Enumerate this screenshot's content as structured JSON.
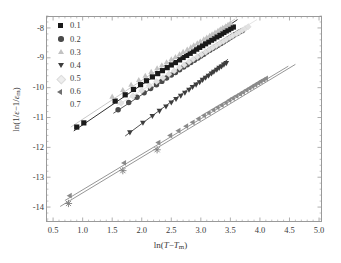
{
  "chart_data": {
    "type": "scatter",
    "title": "",
    "xlabel": "ln(T-Tm)",
    "ylabel": "ln(1/e-1/em)",
    "xlim": [
      0.38,
      5.05
    ],
    "ylim": [
      -14.5,
      -7.6
    ],
    "xticks": [
      0.5,
      1.0,
      1.5,
      2.0,
      2.5,
      3.0,
      3.5,
      4.0,
      4.5,
      5.0
    ],
    "xticklabels": [
      "0.5",
      "1.0",
      "1.5",
      "2.0",
      "2.5",
      "3.0",
      "3.5",
      "4.0",
      "4.5",
      "5.0"
    ],
    "yticks": [
      -8,
      -9,
      -10,
      -11,
      -12,
      -13,
      -14
    ],
    "yticklabels": [
      "-8",
      "-9",
      "-10",
      "-11",
      "-12",
      "-13",
      "-14"
    ],
    "grid": false,
    "minor_ticks": true,
    "legend_position": "upper-left-inside",
    "legend_title": "",
    "series": [
      {
        "name": "0.1",
        "marker": "square",
        "color": "#1a1a1a",
        "fit_line": {
          "x": [
            0.85,
            3.62
          ],
          "y": [
            -11.45,
            -7.72
          ],
          "color": "#1a1a1a"
        },
        "x": [
          0.9,
          1.02,
          1.55,
          1.72,
          1.86,
          1.98,
          2.08,
          2.18,
          2.27,
          2.35,
          2.43,
          2.5,
          2.57,
          2.64,
          2.7,
          2.76,
          2.82,
          2.88,
          2.93,
          2.98,
          3.03,
          3.08,
          3.13,
          3.18,
          3.22,
          3.27,
          3.31,
          3.35,
          3.39,
          3.43,
          3.47,
          3.51,
          3.55
        ],
        "y": [
          -11.32,
          -11.18,
          -10.45,
          -10.24,
          -10.06,
          -9.9,
          -9.77,
          -9.64,
          -9.53,
          -9.43,
          -9.33,
          -9.24,
          -9.16,
          -9.07,
          -8.99,
          -8.92,
          -8.85,
          -8.78,
          -8.71,
          -8.65,
          -8.59,
          -8.53,
          -8.47,
          -8.41,
          -8.36,
          -8.3,
          -8.25,
          -8.2,
          -8.15,
          -8.1,
          -8.06,
          -8.01,
          -7.97
        ]
      },
      {
        "name": "0.2",
        "marker": "circle",
        "color": "#4a4a4a",
        "fit_line": {
          "x": [
            1.52,
            3.72
          ],
          "y": [
            -10.86,
            -8.02
          ],
          "color": "#4a4a4a"
        },
        "x": [
          1.6,
          1.78,
          1.92,
          2.04,
          2.15,
          2.25,
          2.34,
          2.42,
          2.5,
          2.57,
          2.64,
          2.71,
          2.77,
          2.83,
          2.89,
          2.95,
          3.0,
          3.05,
          3.1,
          3.15,
          3.2,
          3.25,
          3.29,
          3.34,
          3.38,
          3.42,
          3.46,
          3.5,
          3.54,
          3.58,
          3.62,
          3.66,
          3.7
        ],
        "y": [
          -10.74,
          -10.5,
          -10.32,
          -10.17,
          -10.03,
          -9.9,
          -9.79,
          -9.68,
          -9.58,
          -9.49,
          -9.4,
          -9.31,
          -9.23,
          -9.16,
          -9.08,
          -9.01,
          -8.94,
          -8.88,
          -8.81,
          -8.75,
          -8.69,
          -8.63,
          -8.58,
          -8.52,
          -8.47,
          -8.42,
          -8.37,
          -8.32,
          -8.27,
          -8.22,
          -8.18,
          -8.13,
          -8.09
        ]
      },
      {
        "name": "0.3",
        "marker": "triangle-up",
        "color": "#c2c2c2",
        "fit_line": {
          "x": [
            0.8,
            3.58
          ],
          "y": [
            -11.32,
            -7.7
          ],
          "color": "#c2c2c2"
        },
        "x": [
          1.5,
          1.68,
          1.82,
          1.95,
          2.06,
          2.16,
          2.26,
          2.34,
          2.42,
          2.5,
          2.57,
          2.64,
          2.7,
          2.77,
          2.83,
          2.88,
          2.94,
          2.99,
          3.05,
          3.1,
          3.15,
          3.19,
          3.24,
          3.29,
          3.33,
          3.37,
          3.42,
          3.46,
          3.5
        ],
        "y": [
          -10.3,
          -10.08,
          -9.9,
          -9.74,
          -9.6,
          -9.47,
          -9.35,
          -9.25,
          -9.15,
          -9.05,
          -8.97,
          -8.88,
          -8.8,
          -8.72,
          -8.65,
          -8.58,
          -8.51,
          -8.45,
          -8.38,
          -8.32,
          -8.26,
          -8.21,
          -8.15,
          -8.09,
          -8.04,
          -7.99,
          -7.94,
          -7.89,
          -7.84
        ]
      },
      {
        "name": "0.4",
        "marker": "triangle-down",
        "color": "#3d3d3d",
        "fit_line": {
          "x": [
            1.72,
            3.46
          ],
          "y": [
            -11.62,
            -9.05
          ],
          "color": "#3d3d3d"
        },
        "x": [
          1.8,
          2.02,
          2.18,
          2.3,
          2.41,
          2.5,
          2.58,
          2.66,
          2.73,
          2.8,
          2.86,
          2.92,
          2.98,
          3.03,
          3.08,
          3.13,
          3.18,
          3.22,
          3.27,
          3.31,
          3.35,
          3.39,
          3.43
        ],
        "y": [
          -11.5,
          -11.18,
          -10.95,
          -10.78,
          -10.63,
          -10.5,
          -10.38,
          -10.27,
          -10.17,
          -10.07,
          -9.98,
          -9.9,
          -9.82,
          -9.74,
          -9.67,
          -9.6,
          -9.53,
          -9.47,
          -9.4,
          -9.34,
          -9.29,
          -9.23,
          -9.18
        ]
      },
      {
        "name": "0.5",
        "marker": "diamond",
        "color": "#e2e2e2",
        "fit_line": {
          "x": [
            1.58,
            3.95
          ],
          "y": [
            -10.6,
            -7.72
          ],
          "color": "#e2e2e2"
        },
        "x": [
          1.65,
          1.85,
          2.0,
          2.13,
          2.25,
          2.36,
          2.46,
          2.55,
          2.64,
          2.72,
          2.8,
          2.87,
          2.94,
          3.01,
          3.08,
          3.14,
          3.2,
          3.26,
          3.32,
          3.38,
          3.43,
          3.49,
          3.54,
          3.6,
          3.65,
          3.7,
          3.75,
          3.8
        ],
        "y": [
          -10.52,
          -10.28,
          -10.1,
          -9.94,
          -9.8,
          -9.67,
          -9.55,
          -9.44,
          -9.33,
          -9.24,
          -9.14,
          -9.05,
          -8.97,
          -8.89,
          -8.81,
          -8.73,
          -8.66,
          -8.59,
          -8.52,
          -8.45,
          -8.39,
          -8.32,
          -8.26,
          -8.2,
          -8.14,
          -8.08,
          -8.02,
          -7.96
        ]
      },
      {
        "name": "0.6",
        "marker": "triangle-left",
        "color": "#8a8a8a",
        "fit_line": {
          "x": [
            0.7,
            4.48
          ],
          "y": [
            -13.78,
            -9.28
          ],
          "color": "#8a8a8a"
        },
        "x": [
          0.78,
          1.7,
          2.28,
          2.48,
          2.62,
          2.75,
          2.86,
          2.96,
          3.05,
          3.13,
          3.21,
          3.28,
          3.35,
          3.42,
          3.48,
          3.54,
          3.6,
          3.66,
          3.71,
          3.77,
          3.82,
          3.87,
          3.92,
          3.97,
          4.01,
          4.06,
          4.1
        ],
        "y": [
          -13.62,
          -12.52,
          -11.84,
          -11.6,
          -11.44,
          -11.29,
          -11.16,
          -11.04,
          -10.93,
          -10.84,
          -10.74,
          -10.66,
          -10.58,
          -10.5,
          -10.42,
          -10.35,
          -10.28,
          -10.21,
          -10.15,
          -10.08,
          -10.02,
          -9.96,
          -9.9,
          -9.84,
          -9.79,
          -9.74,
          -9.69
        ]
      },
      {
        "name": "0.7",
        "marker": "star",
        "color": "#8a8a8a",
        "fit_line": {
          "x": [
            0.62,
            4.6
          ],
          "y": [
            -13.98,
            -9.22
          ],
          "color": "#8a8a8a"
        },
        "x": [
          0.76,
          1.68,
          2.26
        ],
        "y": [
          -13.88,
          -12.78,
          -12.08
        ]
      }
    ]
  },
  "legend": {
    "items": [
      {
        "label": "0.1",
        "marker": "square",
        "color": "#1a1a1a"
      },
      {
        "label": "0.2",
        "marker": "circle",
        "color": "#4a4a4a"
      },
      {
        "label": "0.3",
        "marker": "triangle-up",
        "color": "#c2c2c2"
      },
      {
        "label": "0.4",
        "marker": "triangle-down",
        "color": "#3d3d3d"
      },
      {
        "label": "0.5",
        "marker": "diamond",
        "color": "#eeeeee"
      },
      {
        "label": "0.6",
        "marker": "triangle-left",
        "color": "#6f6f6f"
      },
      {
        "label": "0.7",
        "marker": "star",
        "color": "#ffffff"
      }
    ]
  },
  "axes": {
    "x_title_pre": "ln(",
    "x_title_var1": "T",
    "x_title_minus": "−",
    "x_title_var2": "T",
    "x_title_sub2": "m",
    "x_title_post": ")",
    "y_title_pre": "ln(1/",
    "y_title_var1": "ε",
    "y_title_minus": "−1/",
    "y_title_var2": "ε",
    "y_title_sub2": "m",
    "y_title_post": ")"
  }
}
